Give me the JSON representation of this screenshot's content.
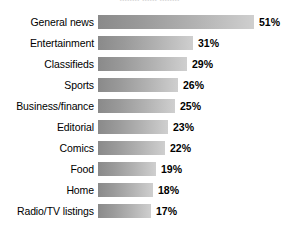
{
  "chart_data": {
    "type": "bar",
    "orientation": "horizontal",
    "title": "",
    "xlabel": "",
    "ylabel": "",
    "xlim": [
      0,
      51
    ],
    "grid": false,
    "legend": null,
    "value_suffix": "%",
    "categories": [
      "General news",
      "Entertainment",
      "Classifieds",
      "Sports",
      "Business/finance",
      "Editorial",
      "Comics",
      "Food",
      "Home",
      "Radio/TV listings"
    ],
    "values": [
      51,
      31,
      29,
      26,
      25,
      23,
      22,
      19,
      18,
      17
    ],
    "value_labels": [
      "51%",
      "31%",
      "29%",
      "26%",
      "25%",
      "23%",
      "22%",
      "19%",
      "18%",
      "17%"
    ],
    "bar_gradient": {
      "from": "#8a8a8a",
      "to": "#cfcfcf",
      "direction": "left-to-right"
    },
    "px_per_unit": 3.06,
    "background": "#ffffff",
    "text_color": "#000000"
  },
  "clipped_title": "........ ...... ........",
  "rows": [
    {
      "label": "General news",
      "value_label": "51%",
      "bar_px": 156
    },
    {
      "label": "Entertainment",
      "value_label": "31%",
      "bar_px": 95
    },
    {
      "label": "Classifieds",
      "value_label": "29%",
      "bar_px": 89
    },
    {
      "label": "Sports",
      "value_label": "26%",
      "bar_px": 80
    },
    {
      "label": "Business/finance",
      "value_label": "25%",
      "bar_px": 77
    },
    {
      "label": "Editorial",
      "value_label": "23%",
      "bar_px": 70
    },
    {
      "label": "Comics",
      "value_label": "22%",
      "bar_px": 67
    },
    {
      "label": "Food",
      "value_label": "19%",
      "bar_px": 58
    },
    {
      "label": "Home",
      "value_label": "18%",
      "bar_px": 55
    },
    {
      "label": "Radio/TV listings",
      "value_label": "17%",
      "bar_px": 53
    }
  ]
}
